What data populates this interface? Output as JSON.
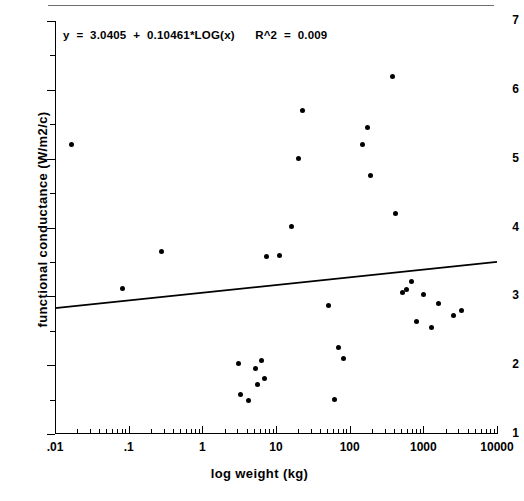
{
  "chart_data": {
    "type": "scatter",
    "title": "",
    "xlabel": "log weight (kg)",
    "ylabel": "functional conductance (W/m2/c)",
    "xscale": "log",
    "yscale": "linear",
    "xlim": [
      0.01,
      10000
    ],
    "ylim": [
      1,
      7
    ],
    "grid": false,
    "legend": null,
    "xticks": [
      ".01",
      ".1",
      "1",
      "10",
      "100",
      "1000",
      "10000"
    ],
    "xtick_values": [
      0.01,
      0.1,
      1,
      10,
      100,
      1000,
      10000
    ],
    "yticks": [
      "1",
      "2",
      "3",
      "4",
      "5",
      "6",
      "7"
    ],
    "ytick_values": [
      1,
      2,
      3,
      4,
      5,
      6,
      7
    ],
    "annotation": "y  =  3.0405  +  0.10461*LOG(x)      R^2  =  0.009",
    "fit": {
      "intercept": 3.0405,
      "slope": 0.10461,
      "r_squared": 0.009,
      "form": "y = 3.0405 + 0.10461*LOG(x)",
      "line_endpoints": [
        {
          "x": 0.01,
          "y": 2.83
        },
        {
          "x": 10000,
          "y": 3.5
        }
      ]
    },
    "points": [
      {
        "x": 0.017,
        "y": 5.2
      },
      {
        "x": 0.082,
        "y": 3.12
      },
      {
        "x": 0.28,
        "y": 3.65
      },
      {
        "x": 3.1,
        "y": 2.03
      },
      {
        "x": 3.3,
        "y": 1.58
      },
      {
        "x": 4.2,
        "y": 1.48
      },
      {
        "x": 5.2,
        "y": 1.95
      },
      {
        "x": 5.6,
        "y": 1.72
      },
      {
        "x": 6.4,
        "y": 2.07
      },
      {
        "x": 7.0,
        "y": 1.8
      },
      {
        "x": 7.4,
        "y": 3.58
      },
      {
        "x": 11.0,
        "y": 3.6
      },
      {
        "x": 16.0,
        "y": 4.02
      },
      {
        "x": 20.0,
        "y": 5.0
      },
      {
        "x": 23.0,
        "y": 5.7
      },
      {
        "x": 52.0,
        "y": 2.87
      },
      {
        "x": 63.0,
        "y": 1.5
      },
      {
        "x": 70.0,
        "y": 2.25
      },
      {
        "x": 82.0,
        "y": 2.1
      },
      {
        "x": 150.0,
        "y": 5.2
      },
      {
        "x": 175.0,
        "y": 5.45
      },
      {
        "x": 190.0,
        "y": 4.75
      },
      {
        "x": 380.0,
        "y": 6.2
      },
      {
        "x": 420.0,
        "y": 4.2
      },
      {
        "x": 520.0,
        "y": 3.06
      },
      {
        "x": 600.0,
        "y": 3.1
      },
      {
        "x": 700.0,
        "y": 3.22
      },
      {
        "x": 820.0,
        "y": 2.63
      },
      {
        "x": 1000.0,
        "y": 3.02
      },
      {
        "x": 1300.0,
        "y": 2.55
      },
      {
        "x": 1600.0,
        "y": 2.9
      },
      {
        "x": 2600.0,
        "y": 2.72
      },
      {
        "x": 3300.0,
        "y": 2.8
      }
    ]
  }
}
